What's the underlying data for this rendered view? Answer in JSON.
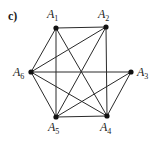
{
  "figure": {
    "part_label": "c)",
    "nodes": [
      {
        "id": "A1",
        "base": "A",
        "sub": "1",
        "x": 56,
        "y": 28,
        "lx": 47,
        "ly": 18
      },
      {
        "id": "A2",
        "base": "A",
        "sub": "2",
        "x": 106,
        "y": 27,
        "lx": 98,
        "ly": 18
      },
      {
        "id": "A3",
        "base": "A",
        "sub": "3",
        "x": 131,
        "y": 72,
        "lx": 137,
        "ly": 76
      },
      {
        "id": "A4",
        "base": "A",
        "sub": "4",
        "x": 107,
        "y": 116,
        "lx": 100,
        "ly": 131
      },
      {
        "id": "A5",
        "base": "A",
        "sub": "5",
        "x": 56,
        "y": 117,
        "lx": 48,
        "ly": 131
      },
      {
        "id": "A6",
        "base": "A",
        "sub": "6",
        "x": 31,
        "y": 72,
        "lx": 13,
        "ly": 76
      }
    ],
    "edges": [
      [
        "A1",
        "A2"
      ],
      [
        "A1",
        "A6"
      ],
      [
        "A1",
        "A5"
      ],
      [
        "A1",
        "A4"
      ],
      [
        "A2",
        "A6"
      ],
      [
        "A2",
        "A5"
      ],
      [
        "A2",
        "A4"
      ],
      [
        "A6",
        "A3"
      ],
      [
        "A6",
        "A5"
      ],
      [
        "A6",
        "A4"
      ],
      [
        "A3",
        "A5"
      ],
      [
        "A3",
        "A4"
      ],
      [
        "A5",
        "A4"
      ]
    ]
  }
}
